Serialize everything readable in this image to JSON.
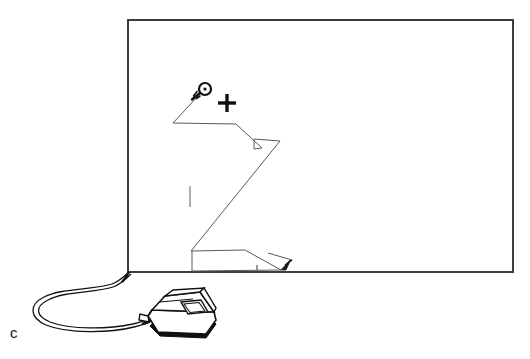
{
  "figure": {
    "kind": "technical-line-drawing",
    "panel_label": "c",
    "caption_text": "",
    "background_color": "#ffffff",
    "ink_color": "#1a1a1a",
    "trace_color": "#4a4a4a",
    "canvas": {
      "width": 530,
      "height": 359
    }
  },
  "tablet": {
    "name": "digitizer-tablet-surface",
    "border_color": "#3c3c3c",
    "border_width_px": 2,
    "rect": {
      "x": 128,
      "y": 20,
      "width": 385,
      "height": 252
    }
  },
  "trace": {
    "name": "stylus-path",
    "description": "hand-drawn zigzag cursor trace across tablet surface",
    "stroke_color": "#5a5a5a",
    "stroke_width_px": 1,
    "points": [
      [
        198,
        96
      ],
      [
        173,
        123
      ],
      [
        236,
        124
      ],
      [
        262,
        148
      ],
      [
        254,
        149
      ],
      [
        254,
        139
      ],
      [
        280,
        141
      ],
      [
        191,
        251
      ],
      [
        245,
        250
      ],
      [
        281,
        270
      ],
      [
        192,
        271
      ],
      [
        192,
        251
      ]
    ],
    "arrow_tip": [
      291,
      262
    ],
    "arrow_label": "path-end-arrowhead"
  },
  "cursor_marker": {
    "name": "puck-crosshair-cursor",
    "circle_center": [
      205,
      89
    ],
    "circle_radius_px": 6,
    "dot_radius_px": 1.6,
    "tail_start": [
      192,
      99
    ],
    "color": "#111111"
  },
  "crosshair": {
    "name": "registration-crosshair",
    "center": [
      227,
      103
    ],
    "arm_length_px": 9,
    "thickness_px": 3.4,
    "color": "#111111"
  },
  "tick_mark": {
    "name": "vertical-tick-mark",
    "x": 190,
    "y_top": 186,
    "y_bottom": 207,
    "color": "#6a6a6a"
  },
  "small_tick": {
    "name": "baseline-tick-mark",
    "x": 257,
    "y_top": 265,
    "y_bottom": 270,
    "color": "#6a6a6a"
  },
  "puck_device": {
    "name": "digitizer-puck",
    "description": "corded puck / mouse with button pad, drawn in perspective",
    "body_color": "#ffffff",
    "outline_color": "#111111",
    "shadow_color": "#111111",
    "anchor": [
      148,
      292
    ]
  },
  "cable": {
    "name": "puck-cable",
    "description": "looping cord from tablet edge to puck",
    "stroke_color": "#111111",
    "stroke_width_px": 1.2,
    "entry_point": [
      130,
      272
    ],
    "exit_point": [
      150,
      322
    ]
  }
}
